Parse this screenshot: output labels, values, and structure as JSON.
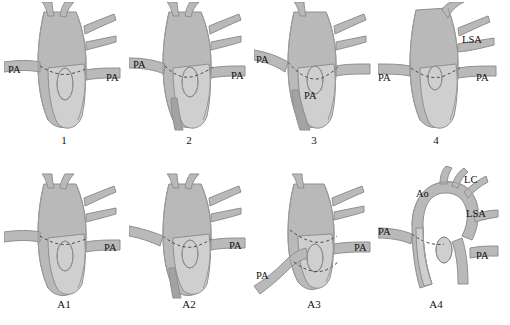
{
  "figure": {
    "title": "",
    "rows": 2,
    "columns": 4,
    "panels": [
      {
        "id": "panel-1",
        "caption": "1",
        "labels": [
          {
            "name": "pa-left",
            "text": "PA",
            "x": 4,
            "y": 62
          },
          {
            "name": "pa-right",
            "text": "PA",
            "x": 102,
            "y": 70
          }
        ]
      },
      {
        "id": "panel-2",
        "caption": "2",
        "labels": [
          {
            "name": "pa-left",
            "text": "PA",
            "x": 4,
            "y": 57
          },
          {
            "name": "pa-right",
            "text": "PA",
            "x": 102,
            "y": 68
          }
        ]
      },
      {
        "id": "panel-3",
        "caption": "3",
        "labels": [
          {
            "name": "pa-left",
            "text": "PA",
            "x": 2,
            "y": 52
          },
          {
            "name": "pa-lower",
            "text": "PA",
            "x": 50,
            "y": 90
          }
        ]
      },
      {
        "id": "panel-4",
        "caption": "4",
        "labels": [
          {
            "name": "lsa",
            "text": "LSA",
            "x": 84,
            "y": 32
          },
          {
            "name": "pa-left",
            "text": "PA",
            "x": 2,
            "y": 70
          },
          {
            "name": "pa-right",
            "text": "PA",
            "x": 100,
            "y": 70
          }
        ]
      },
      {
        "id": "panel-a1",
        "caption": "A1",
        "labels": [
          {
            "name": "pa-right",
            "text": "PA",
            "x": 100,
            "y": 78
          }
        ]
      },
      {
        "id": "panel-a2",
        "caption": "A2",
        "labels": [
          {
            "name": "pa-right",
            "text": "PA",
            "x": 100,
            "y": 78
          }
        ]
      },
      {
        "id": "panel-a3",
        "caption": "A3",
        "labels": [
          {
            "name": "pa-right",
            "text": "PA",
            "x": 100,
            "y": 78
          },
          {
            "name": "pa-lower-left",
            "text": "PA",
            "x": 2,
            "y": 108
          }
        ]
      },
      {
        "id": "panel-a4",
        "caption": "A4",
        "labels": [
          {
            "name": "lc",
            "text": "LC",
            "x": 86,
            "y": 12
          },
          {
            "name": "ao",
            "text": "Ao",
            "x": 40,
            "y": 26
          },
          {
            "name": "lsa",
            "text": "LSA",
            "x": 90,
            "y": 44
          },
          {
            "name": "pa-left",
            "text": "PA",
            "x": 0,
            "y": 62
          },
          {
            "name": "pa-right",
            "text": "PA",
            "x": 100,
            "y": 86
          }
        ]
      }
    ],
    "colors": {
      "vessel_mid": "#b9b9b9",
      "vessel_light": "#cfcfcf",
      "vessel_dark": "#a3a3a3",
      "outline": "#8f8f8f",
      "dash": "#4b4b4b",
      "caption_text": "#111111",
      "background": "#ffffff"
    }
  }
}
